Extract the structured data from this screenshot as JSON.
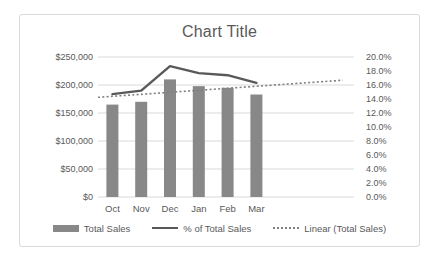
{
  "chart_data": {
    "type": "combo",
    "title": "Chart Title",
    "categories": [
      "Oct",
      "Nov",
      "Dec",
      "Jan",
      "Feb",
      "Mar"
    ],
    "series": [
      {
        "name": "Total Sales",
        "type": "bar",
        "axis": "left",
        "values": [
          165000,
          170000,
          210000,
          198000,
          195000,
          183000
        ]
      },
      {
        "name": "% of Total Sales",
        "type": "line",
        "axis": "right",
        "values": [
          14.7,
          15.2,
          18.7,
          17.7,
          17.4,
          16.3
        ]
      },
      {
        "name": "Linear (Total Sales)",
        "type": "trendline",
        "axis": "left",
        "style": "dotted",
        "start": {
          "index": -0.5,
          "value": 178000
        },
        "end": {
          "index": 8.0,
          "value": 208500
        }
      }
    ],
    "left_axis": {
      "min": 0,
      "max": 250000,
      "ticks": [
        "$0",
        "$50,000",
        "$100,000",
        "$150,000",
        "$200,000",
        "$250,000"
      ]
    },
    "right_axis": {
      "min": 0,
      "max": 20,
      "ticks": [
        "0.0%",
        "2.0%",
        "4.0%",
        "6.0%",
        "8.0%",
        "10.0%",
        "12.0%",
        "14.0%",
        "16.0%",
        "18.0%",
        "20.0%"
      ]
    },
    "grid": "horizontal-major",
    "legend_position": "bottom",
    "colors": {
      "bar": "#888888",
      "line": "#595959",
      "trendline": "#7f7f7f",
      "grid": "#d9d9d9",
      "text": "#595959",
      "frame_border": "#d9d9d9",
      "background": "#ffffff"
    }
  }
}
